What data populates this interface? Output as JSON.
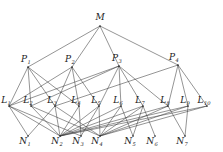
{
  "figure": {
    "kind": "hierarchical-network-diagram",
    "levels": [
      "M",
      "P",
      "L",
      "N"
    ],
    "ink_color": "#3c3c3c",
    "background_color": "#ffffff"
  },
  "nodes": {
    "root": [
      {
        "id": "M",
        "base": "M",
        "sub": "",
        "x": 100,
        "y": 20,
        "px": 100,
        "py": 26
      }
    ],
    "p_level": [
      {
        "id": "P1",
        "base": "P",
        "sub": "1",
        "x": 26,
        "y": 62,
        "px": 28,
        "py": 67
      },
      {
        "id": "P2",
        "base": "P",
        "sub": "2",
        "x": 70,
        "y": 62,
        "px": 72,
        "py": 67
      },
      {
        "id": "P3",
        "base": "P",
        "sub": "3",
        "x": 117,
        "y": 61,
        "px": 119,
        "py": 66
      },
      {
        "id": "P4",
        "base": "P",
        "sub": "4",
        "x": 174,
        "y": 60,
        "px": 178,
        "py": 65
      }
    ],
    "l_level": [
      {
        "id": "L1",
        "base": "L",
        "sub": "1",
        "x": 6,
        "y": 103,
        "px": 9,
        "py": 106
      },
      {
        "id": "L2",
        "base": "L",
        "sub": "2",
        "x": 28,
        "y": 103,
        "px": 31,
        "py": 106
      },
      {
        "id": "L3",
        "base": "L",
        "sub": "3",
        "x": 52,
        "y": 103,
        "px": 55,
        "py": 106
      },
      {
        "id": "L4",
        "base": "L",
        "sub": "4",
        "x": 76,
        "y": 103,
        "px": 79,
        "py": 106
      },
      {
        "id": "L5",
        "base": "L",
        "sub": "5",
        "x": 96,
        "y": 103,
        "px": 99,
        "py": 106
      },
      {
        "id": "L6",
        "base": "L",
        "sub": "6",
        "x": 118,
        "y": 103,
        "px": 121,
        "py": 106
      },
      {
        "id": "L7",
        "base": "L",
        "sub": "7",
        "x": 140,
        "y": 103,
        "px": 143,
        "py": 106
      },
      {
        "id": "L8",
        "base": "L",
        "sub": "8",
        "x": 165,
        "y": 103,
        "px": 168,
        "py": 106
      },
      {
        "id": "L9",
        "base": "L",
        "sub": "9",
        "x": 185,
        "y": 103,
        "px": 188,
        "py": 106
      },
      {
        "id": "L10",
        "base": "L",
        "sub": "10",
        "x": 204,
        "y": 103,
        "px": 207,
        "py": 106
      }
    ],
    "n_level": [
      {
        "id": "N1",
        "base": "N",
        "sub": "1",
        "x": 25,
        "y": 144,
        "px": 28,
        "py": 136
      },
      {
        "id": "N2",
        "base": "N",
        "sub": "2",
        "x": 57,
        "y": 144,
        "px": 60,
        "py": 136
      },
      {
        "id": "N3",
        "base": "N",
        "sub": "3",
        "x": 78,
        "y": 144,
        "px": 81,
        "py": 136
      },
      {
        "id": "N4",
        "base": "N",
        "sub": "4",
        "x": 97,
        "y": 144,
        "px": 100,
        "py": 136
      },
      {
        "id": "N5",
        "base": "N",
        "sub": "5",
        "x": 130,
        "y": 144,
        "px": 133,
        "py": 136
      },
      {
        "id": "N6",
        "base": "N",
        "sub": "6",
        "x": 152,
        "y": 144,
        "px": 155,
        "py": 136
      },
      {
        "id": "N7",
        "base": "N",
        "sub": "7",
        "x": 182,
        "y": 144,
        "px": 185,
        "py": 136
      }
    ]
  },
  "edges": {
    "m_to_p": [
      {
        "from": "M",
        "to": "P1"
      },
      {
        "from": "M",
        "to": "P2"
      },
      {
        "from": "M",
        "to": "P3"
      },
      {
        "from": "M",
        "to": "P4"
      }
    ],
    "p_to_l": [
      {
        "from": "P1",
        "to": "L1"
      },
      {
        "from": "P1",
        "to": "L2"
      },
      {
        "from": "P1",
        "to": "L3"
      },
      {
        "from": "P1",
        "to": "L4"
      },
      {
        "from": "P2",
        "to": "L3"
      },
      {
        "from": "P2",
        "to": "L4"
      },
      {
        "from": "P2",
        "to": "L5"
      },
      {
        "from": "P2",
        "to": "L1"
      },
      {
        "from": "P3",
        "to": "L1"
      },
      {
        "from": "P3",
        "to": "L2"
      },
      {
        "from": "P3",
        "to": "L5"
      },
      {
        "from": "P3",
        "to": "L6"
      },
      {
        "from": "P3",
        "to": "L7"
      },
      {
        "from": "P3",
        "to": "L8"
      },
      {
        "from": "P4",
        "to": "L3"
      },
      {
        "from": "P4",
        "to": "L8"
      },
      {
        "from": "P4",
        "to": "L9"
      },
      {
        "from": "P4",
        "to": "L10"
      }
    ],
    "l_to_n": [
      {
        "from": "L1",
        "to": "N1"
      },
      {
        "from": "L1",
        "to": "N2"
      },
      {
        "from": "L1",
        "to": "N3"
      },
      {
        "from": "L2",
        "to": "N2"
      },
      {
        "from": "L2",
        "to": "N4"
      },
      {
        "from": "L3",
        "to": "N1"
      },
      {
        "from": "L3",
        "to": "N2"
      },
      {
        "from": "L3",
        "to": "N4"
      },
      {
        "from": "L4",
        "to": "N2"
      },
      {
        "from": "L4",
        "to": "N3"
      },
      {
        "from": "L5",
        "to": "N2"
      },
      {
        "from": "L5",
        "to": "N3"
      },
      {
        "from": "L5",
        "to": "N4"
      },
      {
        "from": "L6",
        "to": "N4"
      },
      {
        "from": "L6",
        "to": "N5"
      },
      {
        "from": "L6",
        "to": "N2"
      },
      {
        "from": "L7",
        "to": "N4"
      },
      {
        "from": "L7",
        "to": "N5"
      },
      {
        "from": "L7",
        "to": "N6"
      },
      {
        "from": "L7",
        "to": "N2"
      },
      {
        "from": "L8",
        "to": "N2"
      },
      {
        "from": "L8",
        "to": "N4"
      },
      {
        "from": "L8",
        "to": "N7"
      },
      {
        "from": "L9",
        "to": "N2"
      },
      {
        "from": "L9",
        "to": "N4"
      },
      {
        "from": "L9",
        "to": "N7"
      },
      {
        "from": "L10",
        "to": "N2"
      },
      {
        "from": "L10",
        "to": "N4"
      }
    ]
  }
}
